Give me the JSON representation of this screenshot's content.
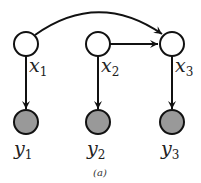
{
  "diagram": {
    "caption": "(a)",
    "colors": {
      "stroke": "#111111",
      "observed_fill": "#999999",
      "latent_fill": "#ffffff"
    },
    "nodes": [
      {
        "id": "x1",
        "var": "x",
        "sub": "1",
        "type": "latent"
      },
      {
        "id": "x2",
        "var": "x",
        "sub": "2",
        "type": "latent"
      },
      {
        "id": "x3",
        "var": "x",
        "sub": "3",
        "type": "latent"
      },
      {
        "id": "y1",
        "var": "y",
        "sub": "1",
        "type": "observed"
      },
      {
        "id": "y2",
        "var": "y",
        "sub": "2",
        "type": "observed"
      },
      {
        "id": "y3",
        "var": "y",
        "sub": "3",
        "type": "observed"
      }
    ],
    "edges": [
      {
        "from": "x1",
        "to": "x3",
        "style": "curved"
      },
      {
        "from": "x2",
        "to": "x3",
        "style": "straight"
      },
      {
        "from": "x1",
        "to": "y1",
        "style": "straight"
      },
      {
        "from": "x2",
        "to": "y2",
        "style": "straight"
      },
      {
        "from": "x3",
        "to": "y3",
        "style": "straight"
      }
    ]
  }
}
